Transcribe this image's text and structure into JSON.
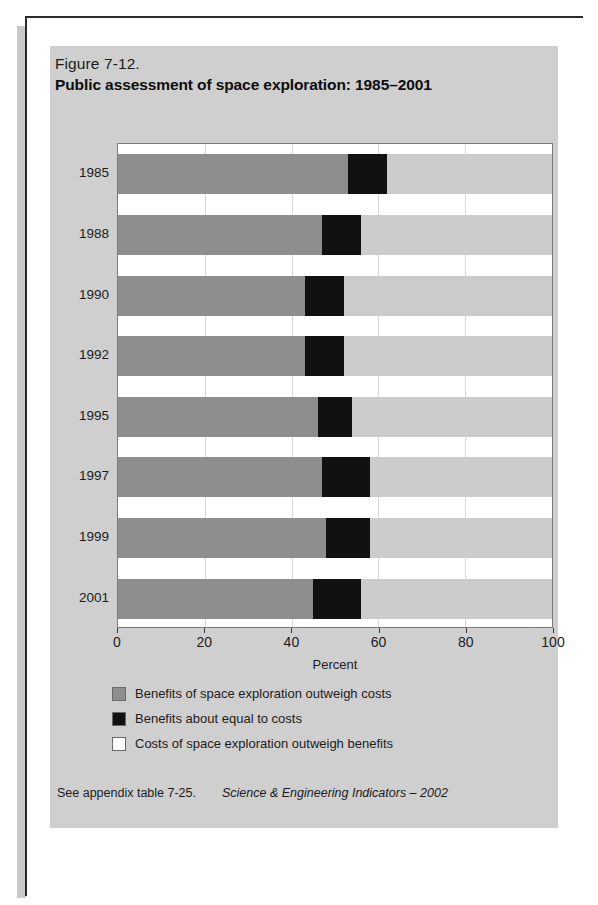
{
  "figure": {
    "number": "Figure 7-12.",
    "title": "Public assessment of space exploration: 1985–2001"
  },
  "legend": {
    "items": [
      {
        "label": "Benefits of space exploration outweigh costs",
        "color": "#8e8e8e",
        "key": "benefit"
      },
      {
        "label": "Benefits about equal to costs",
        "color": "#111111",
        "key": "equal"
      },
      {
        "label": "Costs of space exploration outweigh benefits",
        "color": "#ffffff",
        "key": "cost"
      }
    ]
  },
  "footer": {
    "note": "See appendix table 7-25.",
    "source": "Science & Engineering Indicators – 2002"
  },
  "colors": {
    "panel_background": "#cfcfcf",
    "plot_background": "#ffffff",
    "benefit": "#8e8e8e",
    "equal": "#111111",
    "cost": "#cccccc",
    "page_border": "#2b2b2b",
    "gridline": "#d8d8d8"
  },
  "chart_data": {
    "type": "bar",
    "orientation": "horizontal",
    "stacked": true,
    "title": "Public assessment of space exploration: 1985–2001",
    "subtitle": "Figure 7-12.",
    "xlabel": "Percent",
    "ylabel": "",
    "xlim": [
      0,
      100
    ],
    "xticks": [
      0,
      20,
      40,
      60,
      80,
      100
    ],
    "xticklabels": [
      "0",
      "20",
      "40",
      "60",
      "80",
      "100"
    ],
    "grid": true,
    "legend_position": "below",
    "categories": [
      "1985",
      "1988",
      "1990",
      "1992",
      "1995",
      "1997",
      "1999",
      "2001"
    ],
    "series": [
      {
        "name": "Benefits of space exploration outweigh costs",
        "color": "#8e8e8e",
        "values": [
          53,
          47,
          43,
          43,
          46,
          47,
          48,
          45
        ]
      },
      {
        "name": "Benefits about equal to costs",
        "color": "#111111",
        "values": [
          9,
          9,
          9,
          9,
          8,
          11,
          10,
          11
        ]
      },
      {
        "name": "Costs of space exploration outweigh benefits",
        "color": "#ffffff",
        "values": [
          38,
          44,
          48,
          48,
          46,
          42,
          42,
          44
        ]
      }
    ]
  }
}
